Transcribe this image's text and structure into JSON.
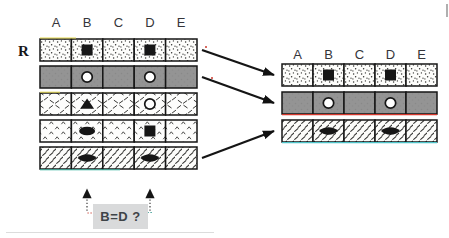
{
  "left_grid": {
    "row_label": "R",
    "column_labels": [
      "A",
      "B",
      "C",
      "D",
      "E"
    ],
    "rows": [
      {
        "texture": "stipple",
        "cells": [
          "",
          "black-square",
          "",
          "black-square",
          ""
        ]
      },
      {
        "texture": "solid-gray",
        "cells": [
          "",
          "white-circle",
          "",
          "white-circle",
          ""
        ]
      },
      {
        "texture": "scatter-dash",
        "cells": [
          "",
          "black-triangle",
          "",
          "outline-circle",
          ""
        ]
      },
      {
        "texture": "caret",
        "cells": [
          "",
          "black-ellipse",
          "",
          "black-square",
          ""
        ]
      },
      {
        "texture": "diagonal-hatch",
        "cells": [
          "",
          "black-oval",
          "",
          "black-oval",
          ""
        ]
      }
    ]
  },
  "right_grid": {
    "column_labels": [
      "A",
      "B",
      "C",
      "D",
      "E"
    ],
    "rows": [
      {
        "texture": "stipple",
        "cells": [
          "",
          "black-square",
          "",
          "black-square",
          ""
        ]
      },
      {
        "texture": "solid-gray",
        "cells": [
          "",
          "white-circle",
          "",
          "white-circle",
          ""
        ]
      },
      {
        "texture": "diagonal-hatch",
        "cells": [
          "",
          "black-oval",
          "",
          "black-oval",
          ""
        ]
      }
    ]
  },
  "mapping_arrows": [
    {
      "from_row": 1,
      "to_row": 1
    },
    {
      "from_row": 2,
      "to_row": 2
    },
    {
      "from_row": 5,
      "to_row": 3
    }
  ],
  "question": {
    "label": "B=D ?",
    "pointed_columns": [
      "B",
      "D"
    ]
  },
  "colors": {
    "ink": "#161616",
    "dark_row_fill": "#949494",
    "question_box_bg": "#d9dadb",
    "question_text": "#3f4448",
    "connector_left": "#c8372a",
    "connector_right": "#1f8f86"
  }
}
